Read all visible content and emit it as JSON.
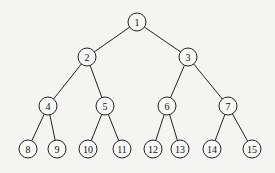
{
  "diagram": {
    "type": "complete-binary-tree",
    "node_radius": 9,
    "nodes": [
      {
        "id": 1,
        "label": "1",
        "x": 137,
        "y": 22
      },
      {
        "id": 2,
        "label": "2",
        "x": 87,
        "y": 57
      },
      {
        "id": 3,
        "label": "3",
        "x": 188,
        "y": 57
      },
      {
        "id": 4,
        "label": "4",
        "x": 48,
        "y": 106
      },
      {
        "id": 5,
        "label": "5",
        "x": 105,
        "y": 106
      },
      {
        "id": 6,
        "label": "6",
        "x": 167,
        "y": 106
      },
      {
        "id": 7,
        "label": "7",
        "x": 228,
        "y": 106
      },
      {
        "id": 8,
        "label": "8",
        "x": 28,
        "y": 149
      },
      {
        "id": 9,
        "label": "9",
        "x": 57,
        "y": 149
      },
      {
        "id": 10,
        "label": "10",
        "x": 88,
        "y": 149
      },
      {
        "id": 11,
        "label": "11",
        "x": 122,
        "y": 149
      },
      {
        "id": 12,
        "label": "12",
        "x": 153,
        "y": 149
      },
      {
        "id": 13,
        "label": "13",
        "x": 180,
        "y": 149
      },
      {
        "id": 14,
        "label": "14",
        "x": 212,
        "y": 149
      },
      {
        "id": 15,
        "label": "15",
        "x": 252,
        "y": 149
      }
    ],
    "edges": [
      [
        1,
        2
      ],
      [
        1,
        3
      ],
      [
        2,
        4
      ],
      [
        2,
        5
      ],
      [
        3,
        6
      ],
      [
        3,
        7
      ],
      [
        4,
        8
      ],
      [
        4,
        9
      ],
      [
        5,
        10
      ],
      [
        5,
        11
      ],
      [
        6,
        12
      ],
      [
        6,
        13
      ],
      [
        7,
        14
      ],
      [
        7,
        15
      ]
    ]
  }
}
